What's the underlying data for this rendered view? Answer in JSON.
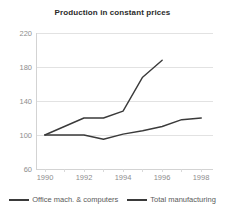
{
  "chart_data": {
    "type": "line",
    "title": "Production in constant prices",
    "xlabel": "",
    "ylabel": "",
    "xlim": [
      1989.6,
      1998.6
    ],
    "ylim": [
      60,
      220
    ],
    "grid": true,
    "legend_position": "bottom",
    "y_ticks": [
      220,
      180,
      140,
      100,
      60
    ],
    "x_ticks": [
      1990,
      1992,
      1994,
      1996,
      1998
    ],
    "x_tick_labels": [
      "1990",
      "1992",
      "1994",
      "1996",
      "1998"
    ],
    "y_tick_labels": [
      "220",
      "180",
      "140",
      "100",
      "60"
    ],
    "series": [
      {
        "name": "Office mach. & computers",
        "color": "#3a3a3a",
        "x": [
          1990,
          1991,
          1992,
          1993,
          1994,
          1995,
          1996
        ],
        "values": [
          100,
          110,
          120,
          120,
          128,
          168,
          188
        ]
      },
      {
        "name": "Total manufacturing",
        "color": "#3a3a3a",
        "x": [
          1990,
          1991,
          1992,
          1993,
          1994,
          1995,
          1996,
          1997,
          1998
        ],
        "values": [
          100,
          100,
          100,
          95,
          101,
          105,
          110,
          118,
          120
        ]
      }
    ]
  },
  "legend": {
    "items": [
      {
        "label": "Office mach. & computers"
      },
      {
        "label": "Total manufacturing"
      }
    ]
  }
}
